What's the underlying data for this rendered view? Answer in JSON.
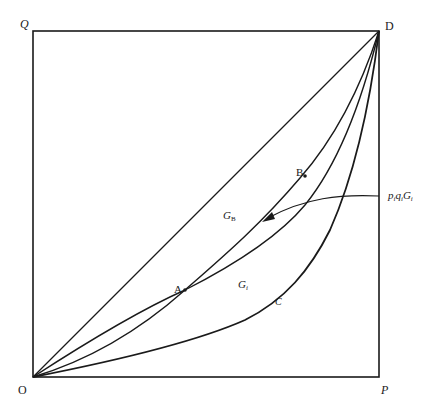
{
  "diagram": {
    "type": "edgeworth-box-contract-curves",
    "corners": {
      "top_left": "Q",
      "top_right": "D",
      "bottom_left": "O",
      "bottom_right": "P"
    },
    "points": {
      "A": "A",
      "B": "B"
    },
    "regions": {
      "GB_main": "G",
      "GB_sub": "B",
      "GC_main": "G",
      "GC_sub": "i"
    },
    "curve_labels": {
      "C": "C"
    },
    "annotation": {
      "p": "p",
      "p_sub": "i",
      "q": "q",
      "q_sub": "i",
      "G": "G",
      "G_sub": "i"
    },
    "colors": {
      "line": "#1a1a1a",
      "background": "#ffffff"
    }
  }
}
